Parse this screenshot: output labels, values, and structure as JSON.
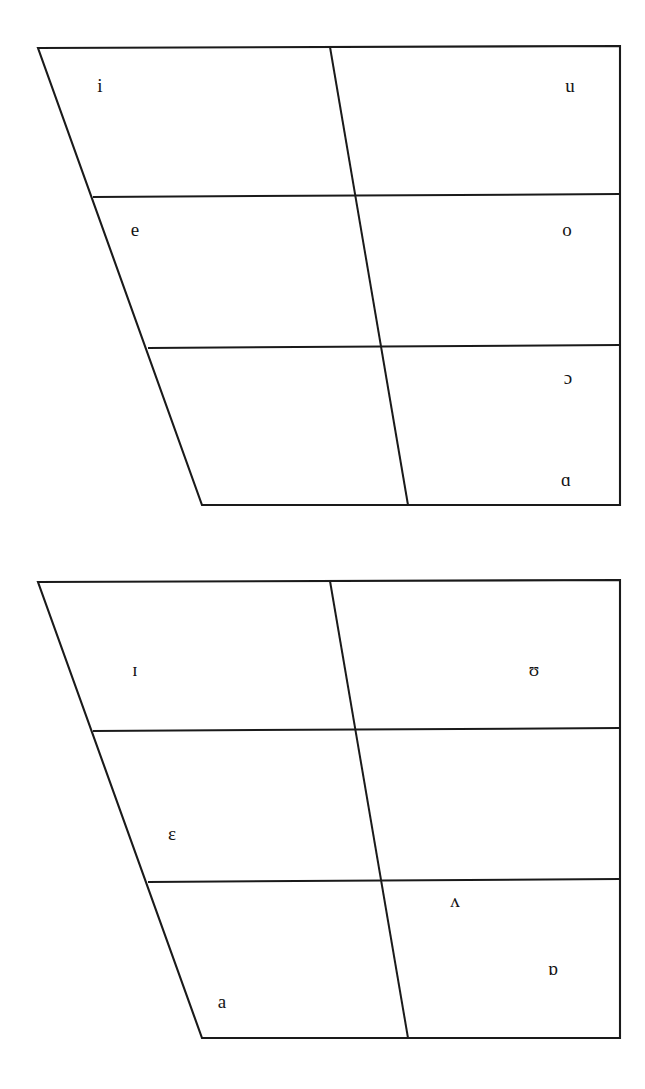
{
  "figure": {
    "name": "vowel-quadrilateral-pair",
    "background_color": "#ffffff",
    "line_color": "#1a1a1a",
    "text_color": "#141414"
  },
  "chart_data": {
    "type": "scatter",
    "title": "",
    "subtitle": "",
    "xlabel": "",
    "ylabel": "",
    "grid": false,
    "legend": null,
    "charts": [
      {
        "id": "upper-quadrilateral",
        "name": "tense-vowel-quadrilateral",
        "outline": {
          "top_left": [
            38,
            48
          ],
          "top_right": [
            620,
            46
          ],
          "bottom_right": [
            620,
            505
          ],
          "bottom_left": [
            202,
            505
          ]
        },
        "horizontal_dividers": [
          {
            "id": "upper-div-high-mid",
            "left": [
              93,
              197
            ],
            "right": [
              620,
              194
            ]
          },
          {
            "id": "upper-div-mid-low",
            "left": [
              148,
              348
            ],
            "right": [
              620,
              345
            ]
          }
        ],
        "vertical_dividers": [
          {
            "id": "upper-center-line",
            "top": [
              330,
              47
            ],
            "bottom": [
              408,
              505
            ]
          }
        ],
        "labels": [
          {
            "symbol": "i",
            "x": 100,
            "y": 88,
            "name": "vowel-label-i",
            "ipa": "close front unrounded"
          },
          {
            "symbol": "u",
            "x": 570,
            "y": 88,
            "name": "vowel-label-u",
            "ipa": "close back rounded"
          },
          {
            "symbol": "e",
            "x": 135,
            "y": 232,
            "name": "vowel-label-e",
            "ipa": "close-mid front unrounded"
          },
          {
            "symbol": "o",
            "x": 567,
            "y": 232,
            "name": "vowel-label-o",
            "ipa": "close-mid back rounded"
          },
          {
            "symbol": "ɔ",
            "x": 568,
            "y": 380,
            "name": "vowel-label-open-o",
            "ipa": "open-mid back rounded"
          },
          {
            "symbol": "ɑ",
            "x": 566,
            "y": 482,
            "name": "vowel-label-script-a",
            "ipa": "open back unrounded"
          }
        ]
      },
      {
        "id": "lower-quadrilateral",
        "name": "lax-vowel-quadrilateral",
        "outline": {
          "top_left": [
            38,
            582
          ],
          "top_right": [
            620,
            580
          ],
          "bottom_right": [
            620,
            1038
          ],
          "bottom_left": [
            202,
            1038
          ]
        },
        "horizontal_dividers": [
          {
            "id": "lower-div-high-mid",
            "left": [
              93,
              731
            ],
            "right": [
              620,
              728
            ]
          },
          {
            "id": "lower-div-mid-low",
            "left": [
              148,
              882
            ],
            "right": [
              620,
              879
            ]
          }
        ],
        "vertical_dividers": [
          {
            "id": "lower-center-line",
            "top": [
              330,
              581
            ],
            "bottom": [
              408,
              1038
            ]
          }
        ],
        "labels": [
          {
            "symbol": "ɪ",
            "x": 135,
            "y": 672,
            "name": "vowel-label-small-cap-i",
            "ipa": "near-close near-front unrounded"
          },
          {
            "symbol": "ʊ",
            "x": 534,
            "y": 672,
            "name": "vowel-label-upsilon",
            "ipa": "near-close near-back rounded"
          },
          {
            "symbol": "ɛ",
            "x": 172,
            "y": 836,
            "name": "vowel-label-epsilon",
            "ipa": "open-mid front unrounded"
          },
          {
            "symbol": "ʌ",
            "x": 455,
            "y": 903,
            "name": "vowel-label-turned-v",
            "ipa": "open-mid back unrounded"
          },
          {
            "symbol": "ɒ",
            "x": 553,
            "y": 971,
            "name": "vowel-label-turned-script-a",
            "ipa": "open back rounded"
          },
          {
            "symbol": "a",
            "x": 222,
            "y": 1004,
            "name": "vowel-label-a",
            "ipa": "open front unrounded"
          }
        ]
      }
    ]
  }
}
